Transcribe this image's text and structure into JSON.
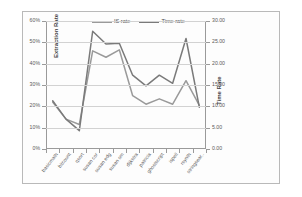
{
  "chart_data": {
    "type": "line",
    "title": "",
    "xlabel": "",
    "ylabel": "Extraction Rate",
    "y2label": "Time Rate",
    "grid": true,
    "legend_position": "top-center",
    "categories": [
      "basicmath",
      "bitcount",
      "qsort",
      "susan cor",
      "susan edg",
      "susan sm",
      "dijkstra",
      "patricia",
      "ghostscript",
      "ispell",
      "rsynth",
      "stringsear.."
    ],
    "ylim": [
      0,
      0.6
    ],
    "yticks": [
      "0%",
      "10%",
      "20%",
      "30%",
      "40%",
      "50%",
      "60%"
    ],
    "ytick_values": [
      0,
      0.1,
      0.2,
      0.3,
      0.4,
      0.5,
      0.6
    ],
    "y2lim": [
      0,
      30
    ],
    "y2ticks": [
      "0.00",
      "5.00",
      "10.00",
      "15.00",
      "20.00",
      "25.00",
      "30.00"
    ],
    "y2tick_values": [
      0,
      5,
      10,
      15,
      20,
      25,
      30
    ],
    "series": [
      {
        "name": "IS rate",
        "axis": "left",
        "color": "#9a9a9a",
        "values": [
          0.22,
          0.14,
          0.115,
          0.46,
          0.43,
          0.465,
          0.25,
          0.21,
          0.235,
          0.21,
          0.32,
          0.205
        ]
      },
      {
        "name": "Time rate",
        "axis": "right",
        "color": "#7a7a7a",
        "values": [
          11.3,
          7.0,
          4.3,
          27.6,
          24.6,
          24.8,
          17.3,
          14.8,
          17.3,
          15.4,
          25.9,
          9.8
        ]
      }
    ]
  },
  "legend": {
    "entries": [
      {
        "label": "IS rate"
      },
      {
        "label": "Time rate"
      }
    ]
  }
}
